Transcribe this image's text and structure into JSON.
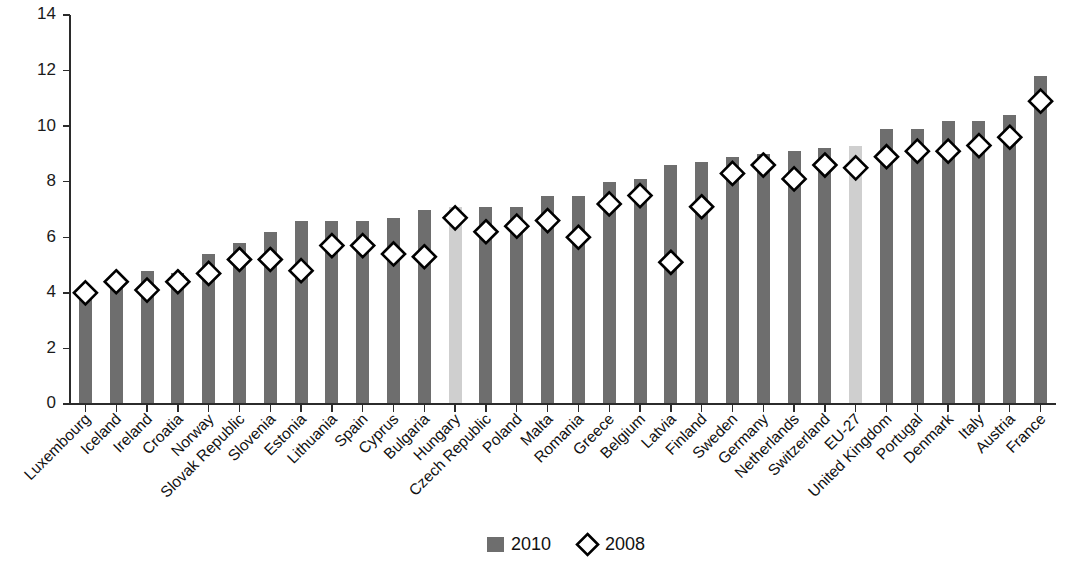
{
  "chart_data": {
    "type": "bar",
    "title": "",
    "subtitle": "",
    "xlabel": "",
    "ylabel": "",
    "ylim": [
      0,
      14
    ],
    "ytick_values": [
      0,
      2,
      4,
      6,
      8,
      10,
      12,
      14
    ],
    "ytick_labels": [
      "0",
      "2",
      "4",
      "6",
      "8",
      "10",
      "12",
      "14"
    ],
    "grid": false,
    "legend_position": "bottom-center",
    "categories": [
      "Luxembourg",
      "Iceland",
      "Ireland",
      "Croatia",
      "Norway",
      "Slovak Republic",
      "Slovenia",
      "Estonia",
      "Lithuania",
      "Spain",
      "Cyprus",
      "Bulgaria",
      "Hungary",
      "Czech Republic",
      "Poland",
      "Malta",
      "Romania",
      "Greece",
      "Belgium",
      "Latvia",
      "Finland",
      "Sweden",
      "Germany",
      "Netherlands",
      "Switzerland",
      "EU-27",
      "United Kingdom",
      "Portugal",
      "Denmark",
      "Italy",
      "Austria",
      "France"
    ],
    "highlighted_categories": [
      "Hungary",
      "EU-27"
    ],
    "series": [
      {
        "name": "2010",
        "type": "bar",
        "color": "#6e6e6e",
        "highlight_color": "#cfcfcf",
        "values": [
          3.9,
          4.4,
          4.8,
          4.7,
          5.4,
          5.8,
          6.2,
          6.6,
          6.6,
          6.6,
          6.7,
          7.0,
          7.1,
          7.1,
          7.1,
          7.5,
          7.5,
          8.0,
          8.1,
          8.6,
          8.7,
          8.9,
          9.0,
          9.1,
          9.2,
          9.3,
          9.9,
          9.9,
          10.2,
          10.2,
          10.4,
          11.8
        ]
      },
      {
        "name": "2008",
        "type": "scatter",
        "marker": "diamond",
        "color": "#ffffff",
        "edge_color": "#000000",
        "values": [
          4.0,
          4.4,
          4.1,
          4.4,
          4.7,
          5.2,
          5.2,
          4.8,
          5.7,
          5.7,
          5.4,
          5.3,
          6.7,
          6.2,
          6.4,
          6.6,
          6.0,
          7.2,
          7.5,
          5.1,
          7.1,
          8.3,
          8.6,
          8.1,
          8.6,
          8.5,
          8.9,
          9.1,
          9.1,
          9.3,
          9.6,
          10.9
        ]
      }
    ],
    "legend": [
      {
        "label": "2010",
        "marker": "square",
        "color": "#6e6e6e"
      },
      {
        "label": "2008",
        "marker": "diamond",
        "color": "#ffffff"
      }
    ]
  },
  "colors": {
    "background": "#ffffff",
    "axis": "#2b2b2b",
    "bar": "#6e6e6e",
    "bar_highlight": "#cfcfcf",
    "marker_fill": "#ffffff",
    "marker_stroke": "#000000",
    "text": "#111111"
  }
}
